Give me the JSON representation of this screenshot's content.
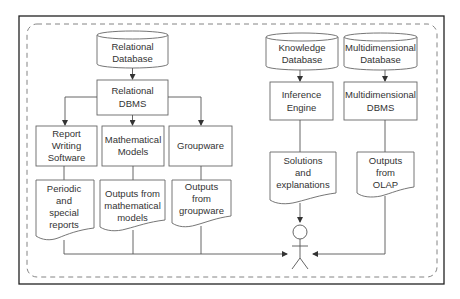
{
  "diagram": {
    "colors": {
      "stroke": "#555555",
      "frame": "#222222",
      "text": "#333333",
      "background": "#ffffff"
    },
    "nodes": {
      "relational_database": {
        "type": "database",
        "lines": [
          "Relational",
          "Database"
        ]
      },
      "relational_dbms": {
        "type": "process",
        "lines": [
          "Relational",
          "DBMS"
        ]
      },
      "report_writing_software": {
        "type": "process",
        "lines": [
          "Report",
          "Writing",
          "Software"
        ]
      },
      "mathematical_models": {
        "type": "process",
        "lines": [
          "Mathematical",
          "Models"
        ]
      },
      "groupware": {
        "type": "process",
        "lines": [
          "Groupware"
        ]
      },
      "periodic_reports": {
        "type": "document",
        "lines": [
          "Periodic",
          "and",
          "special",
          "reports"
        ]
      },
      "outputs_math_models": {
        "type": "document",
        "lines": [
          "Outputs from",
          "mathematical",
          "models"
        ]
      },
      "outputs_groupware": {
        "type": "document",
        "lines": [
          "Outputs",
          "from",
          "groupware"
        ]
      },
      "knowledge_database": {
        "type": "database",
        "lines": [
          "Knowledge",
          "Database"
        ]
      },
      "multidimensional_database": {
        "type": "database",
        "lines": [
          "Multidimensional",
          "Database"
        ]
      },
      "inference_engine": {
        "type": "process",
        "lines": [
          "Inference",
          "Engine"
        ]
      },
      "multidimensional_dbms": {
        "type": "process",
        "lines": [
          "Multidimensional",
          "DBMS"
        ]
      },
      "solutions_explanations": {
        "type": "document",
        "lines": [
          "Solutions",
          "and",
          "explanations"
        ]
      },
      "outputs_olap": {
        "type": "document",
        "lines": [
          "Outputs",
          "from",
          "OLAP"
        ]
      },
      "user": {
        "type": "actor",
        "lines": []
      }
    },
    "edges": [
      {
        "from": "relational_database",
        "to": "relational_dbms"
      },
      {
        "from": "relational_dbms",
        "to": "report_writing_software"
      },
      {
        "from": "relational_dbms",
        "to": "mathematical_models"
      },
      {
        "from": "relational_dbms",
        "to": "groupware"
      },
      {
        "from": "report_writing_software",
        "to": "periodic_reports"
      },
      {
        "from": "mathematical_models",
        "to": "outputs_math_models"
      },
      {
        "from": "groupware",
        "to": "outputs_groupware"
      },
      {
        "from": "periodic_reports",
        "to": "user"
      },
      {
        "from": "outputs_math_models",
        "to": "user"
      },
      {
        "from": "outputs_groupware",
        "to": "user"
      },
      {
        "from": "knowledge_database",
        "to": "inference_engine"
      },
      {
        "from": "inference_engine",
        "to": "solutions_explanations"
      },
      {
        "from": "solutions_explanations",
        "to": "user"
      },
      {
        "from": "multidimensional_database",
        "to": "multidimensional_dbms"
      },
      {
        "from": "multidimensional_dbms",
        "to": "outputs_olap"
      },
      {
        "from": "outputs_olap",
        "to": "user"
      }
    ]
  }
}
